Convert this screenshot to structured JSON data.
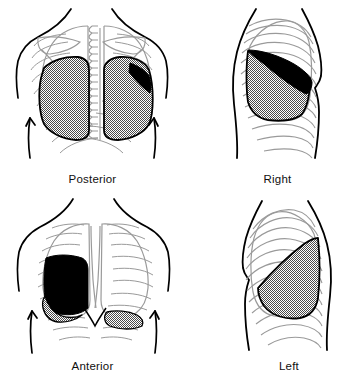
{
  "figure": {
    "type": "anatomical-illustration",
    "background_color": "#ffffff",
    "line_color": "#000000",
    "bone_line_color": "#9a9a9a",
    "stipple_color": "#808080",
    "solid_fill_color": "#000000",
    "grid": {
      "rows": 2,
      "columns": 2
    }
  },
  "panels": [
    {
      "id": "posterior",
      "label": "Posterior",
      "position": "top-left",
      "view": "back",
      "shaded_regions": [
        {
          "style": "stipple",
          "name": "right-lower-lobe"
        },
        {
          "style": "stipple",
          "name": "left-lower-lobe"
        },
        {
          "style": "solid-black",
          "name": "left-lingula-wedge"
        }
      ],
      "structures": [
        "shoulders",
        "arms",
        "spine",
        "scapulae",
        "ribs",
        "lungs"
      ]
    },
    {
      "id": "right",
      "label": "Right",
      "position": "top-right",
      "view": "right-lateral",
      "shaded_regions": [
        {
          "style": "stipple",
          "name": "right-lower-lobe"
        },
        {
          "style": "solid-black",
          "name": "right-middle-lobe"
        }
      ],
      "structures": [
        "torso-profile",
        "ribs",
        "lung"
      ]
    },
    {
      "id": "anterior",
      "label": "Anterior",
      "position": "bottom-left",
      "view": "front",
      "shaded_regions": [
        {
          "style": "solid-black",
          "name": "right-middle-lobe"
        },
        {
          "style": "stipple",
          "name": "right-lower-lobe"
        },
        {
          "style": "stipple",
          "name": "left-lower-lobe"
        }
      ],
      "structures": [
        "shoulders",
        "arms",
        "sternum",
        "costal-margin",
        "ribs",
        "lungs"
      ]
    },
    {
      "id": "left",
      "label": "Left",
      "position": "bottom-right",
      "view": "left-lateral",
      "shaded_regions": [
        {
          "style": "stipple",
          "name": "left-lower-lobe"
        }
      ],
      "structures": [
        "torso-profile",
        "ribs",
        "lung"
      ]
    }
  ]
}
